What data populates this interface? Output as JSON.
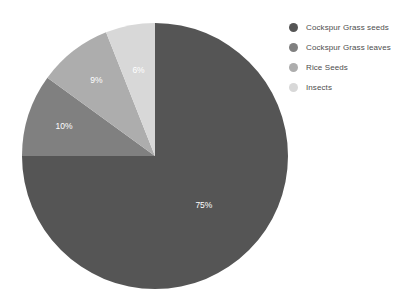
{
  "chart_data": {
    "type": "pie",
    "title": "",
    "subtitle": "",
    "xlabel": "",
    "ylabel": "",
    "grid": false,
    "legend_position": "right",
    "start_angle_deg": 0,
    "direction": "clockwise",
    "units": "percent",
    "categories": [
      "Cockspur Grass seeds",
      "Cockspur Grass leaves",
      "Rice Seeds",
      "Insects"
    ],
    "values": [
      75,
      10,
      9,
      6
    ],
    "data_labels": [
      "75%",
      "10%",
      "9%",
      "6%"
    ],
    "colors": [
      "#555555",
      "#808080",
      "#adadad",
      "#d8d8d8"
    ],
    "slices": [
      {
        "label": "Cockspur Grass seeds",
        "value": 75,
        "data_label": "75%",
        "color": "#555555",
        "start_deg": 0,
        "sweep_deg": 270
      },
      {
        "label": "Cockspur Grass leaves",
        "value": 10,
        "data_label": "10%",
        "color": "#808080",
        "start_deg": 270,
        "sweep_deg": 36
      },
      {
        "label": "Rice Seeds",
        "value": 9,
        "data_label": "9%",
        "color": "#adadad",
        "start_deg": 306,
        "sweep_deg": 32.4
      },
      {
        "label": "Insects",
        "value": 6,
        "data_label": "6%",
        "color": "#d8d8d8",
        "start_deg": 338.4,
        "sweep_deg": 21.6
      }
    ]
  },
  "legend": {
    "items": [
      {
        "label": "Cockspur Grass seeds",
        "color": "#555555"
      },
      {
        "label": "Cockspur Grass leaves",
        "color": "#808080"
      },
      {
        "label": "Rice Seeds",
        "color": "#adadad"
      },
      {
        "label": "Insects",
        "color": "#d8d8d8"
      }
    ]
  }
}
